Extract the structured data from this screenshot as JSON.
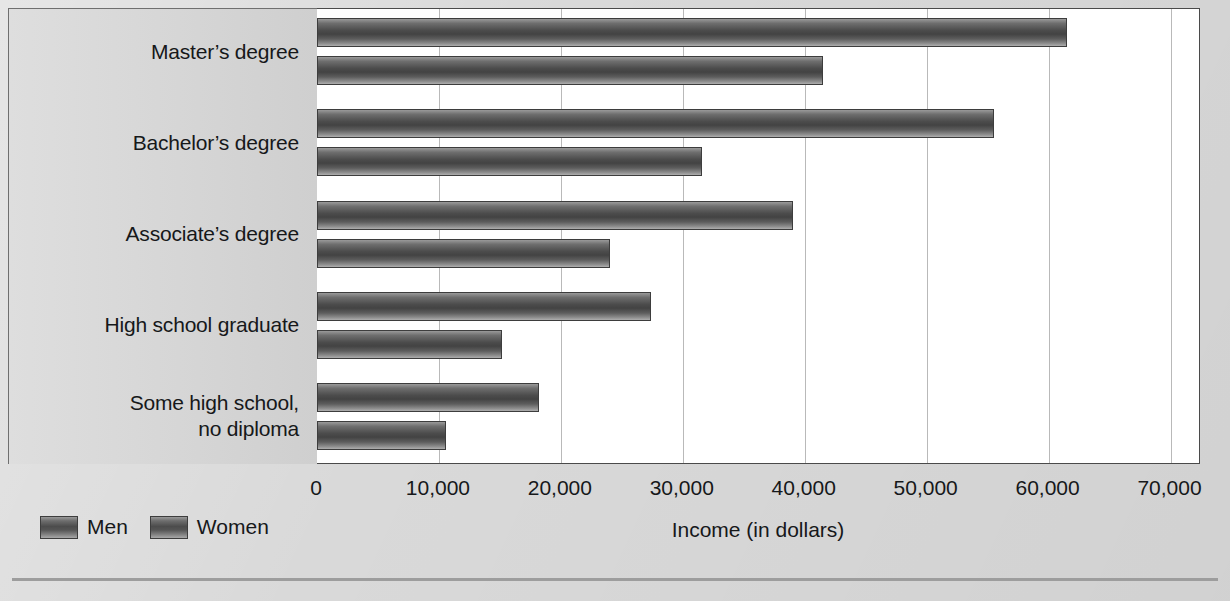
{
  "chart_data": {
    "type": "bar",
    "orientation": "horizontal",
    "title": "",
    "xlabel": "Income (in dollars)",
    "ylabel": "",
    "xlim": [
      0,
      72500
    ],
    "xticks": [
      0,
      10000,
      20000,
      30000,
      40000,
      50000,
      60000,
      70000
    ],
    "xtick_labels": [
      "0",
      "10,000",
      "20,000",
      "30,000",
      "40,000",
      "50,000",
      "60,000",
      "70,000"
    ],
    "grid": true,
    "grid_axis": "x",
    "legend_position": "bottom-left",
    "categories": [
      "Master’s degree",
      "Bachelor’s degree",
      "Associate’s degree",
      "High school graduate",
      "Some high school,\nno diploma"
    ],
    "series": [
      {
        "name": "Men",
        "color": "#4c4c4c",
        "values": [
          61500,
          55500,
          39000,
          27400,
          18200
        ]
      },
      {
        "name": "Women",
        "color": "#4c4c4c",
        "values": [
          41500,
          31600,
          24000,
          15200,
          10600
        ]
      }
    ]
  },
  "legend": {
    "items": [
      {
        "label": "Men"
      },
      {
        "label": "Women"
      }
    ]
  },
  "axis": {
    "title": "Income (in dollars)",
    "ticks": [
      "0",
      "10,000",
      "20,000",
      "30,000",
      "40,000",
      "50,000",
      "60,000",
      "70,000"
    ]
  },
  "categories": [
    {
      "label": "Master’s degree"
    },
    {
      "label": "Bachelor’s degree"
    },
    {
      "label": "Associate’s degree"
    },
    {
      "label": "High school graduate"
    },
    {
      "label": "Some high school,\nno diploma"
    }
  ],
  "colors": {
    "background": "#d9d9d9",
    "plot_background": "#ffffff",
    "bar": "#4c4c4c",
    "gridline": "#b9b9b9",
    "axis": "#4a4a4a",
    "text": "#16181a"
  }
}
